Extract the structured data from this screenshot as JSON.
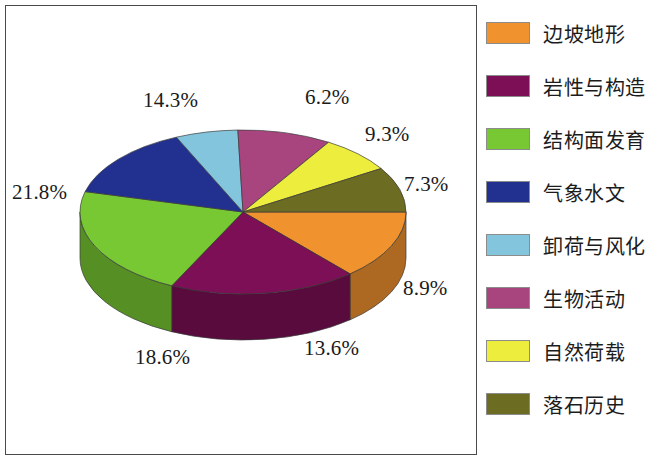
{
  "chart_data": {
    "type": "pie",
    "title": "",
    "subtitle": "",
    "xlabel": "",
    "ylabel": "",
    "legend_position": "right",
    "three_d": true,
    "grid": false,
    "categories": [
      "边坡地形",
      "岩性与构造",
      "结构面发育",
      "气象水文",
      "卸荷与风化",
      "生物活动",
      "自然荷载",
      "落石历史"
    ],
    "values": [
      13.6,
      18.6,
      21.8,
      14.3,
      6.2,
      9.3,
      7.3,
      8.9
    ],
    "value_labels": [
      "13.6%",
      "18.6%",
      "21.8%",
      "14.3%",
      "6.2%",
      "9.3%",
      "7.3%",
      "8.9%"
    ],
    "colors": [
      "#F0922E",
      "#7C0F56",
      "#77C833",
      "#22318F",
      "#84C5DE",
      "#A8457F",
      "#EDED3E",
      "#6C6C22"
    ],
    "side_colors": [
      "#C8761F",
      "#5C0B40",
      "#5C9E24",
      "#1A2670",
      "#679BB0",
      "#833563",
      "#B9B92E",
      "#565617"
    ],
    "total": 100.0
  },
  "slices": [
    {
      "label": "边坡地形",
      "value": 13.6,
      "value_label": "13.6%",
      "color": "#F0922E"
    },
    {
      "label": "岩性与构造",
      "value": 18.6,
      "value_label": "18.6%",
      "color": "#7C0F56"
    },
    {
      "label": "结构面发育",
      "value": 21.8,
      "value_label": "21.8%",
      "color": "#77C833"
    },
    {
      "label": "气象水文",
      "value": 14.3,
      "value_label": "14.3%",
      "color": "#22318F"
    },
    {
      "label": "卸荷与风化",
      "value": 6.2,
      "value_label": "6.2%",
      "color": "#84C5DE"
    },
    {
      "label": "生物活动",
      "value": 9.3,
      "value_label": "9.3%",
      "color": "#A8457F"
    },
    {
      "label": "自然荷载",
      "value": 7.3,
      "value_label": "7.3%",
      "color": "#EDED3E"
    },
    {
      "label": "落石历史",
      "value": 8.9,
      "value_label": "8.9%",
      "color": "#6C6C22"
    }
  ],
  "legend": {
    "items": [
      {
        "label": "边坡地形",
        "color": "#F0922E"
      },
      {
        "label": "岩性与构造",
        "color": "#7C0F56"
      },
      {
        "label": "结构面发育",
        "color": "#77C833"
      },
      {
        "label": "气象水文",
        "color": "#22318F"
      },
      {
        "label": "卸荷与风化",
        "color": "#84C5DE"
      },
      {
        "label": "生物活动",
        "color": "#A8457F"
      },
      {
        "label": "自然荷载",
        "color": "#EDED3E"
      },
      {
        "label": "落石历史",
        "color": "#6C6C22"
      }
    ]
  },
  "label_positions": [
    {
      "value_label": "14.3%",
      "x": 143,
      "y": 88
    },
    {
      "value_label": "6.2%",
      "x": 305,
      "y": 85
    },
    {
      "value_label": "9.3%",
      "x": 365,
      "y": 122
    },
    {
      "value_label": "7.3%",
      "x": 404,
      "y": 172
    },
    {
      "value_label": "8.9%",
      "x": 403,
      "y": 276
    },
    {
      "value_label": "13.6%",
      "x": 304,
      "y": 336
    },
    {
      "value_label": "18.6%",
      "x": 135,
      "y": 345
    },
    {
      "value_label": "21.8%",
      "x": 12,
      "y": 180
    }
  ],
  "geometry": {
    "cx": 243,
    "cy": 212,
    "rx": 163,
    "ry": 82,
    "depth": 46,
    "start_angle_deg": 0
  },
  "frame": {
    "border_color": "#4a4a4a",
    "background": "#ffffff"
  }
}
